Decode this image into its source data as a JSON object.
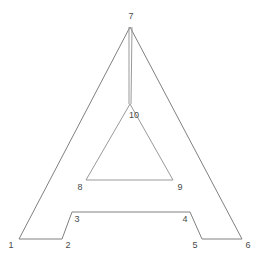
{
  "figure": {
    "background_color": "#ffffff",
    "stroke_color": "#808080",
    "inner_stroke_color": "#999999",
    "label_color": "#4a4a4a",
    "stroke_width": 1,
    "width": 262,
    "height": 260
  },
  "outer_outline": {
    "name": "letter-a-outer-outline",
    "points": "19,239 62,239 72,212 190,212 202,239 242,239 130,27 19,239"
  },
  "inner_counter": {
    "name": "letter-a-inner-triangle",
    "points": "86,180 173,180 130,104 86,180"
  },
  "stem_segments": [
    {
      "name": "stem-left-line",
      "x1": 129,
      "y1": 27,
      "x2": 129,
      "y2": 104
    },
    {
      "name": "stem-right-line",
      "x1": 132,
      "y1": 27,
      "x2": 131,
      "y2": 104
    }
  ],
  "vertices": [
    {
      "id": "1",
      "label": "1",
      "x": 19,
      "y": 239,
      "label_x": 11,
      "label_y": 245
    },
    {
      "id": "2",
      "label": "2",
      "x": 62,
      "y": 239,
      "label_x": 68,
      "label_y": 245
    },
    {
      "id": "3",
      "label": "3",
      "x": 72,
      "y": 212,
      "label_x": 77,
      "label_y": 219
    },
    {
      "id": "4",
      "label": "4",
      "x": 190,
      "y": 212,
      "label_x": 185,
      "label_y": 219
    },
    {
      "id": "5",
      "label": "5",
      "x": 202,
      "y": 239,
      "label_x": 195,
      "label_y": 245
    },
    {
      "id": "6",
      "label": "6",
      "x": 242,
      "y": 239,
      "label_x": 248,
      "label_y": 245
    },
    {
      "id": "7",
      "label": "7",
      "x": 130,
      "y": 27,
      "label_x": 131,
      "label_y": 16
    },
    {
      "id": "8",
      "label": "8",
      "x": 86,
      "y": 180,
      "label_x": 80,
      "label_y": 187
    },
    {
      "id": "9",
      "label": "9",
      "x": 173,
      "y": 180,
      "label_x": 180,
      "label_y": 187
    },
    {
      "id": "10",
      "label": "10",
      "x": 130,
      "y": 104,
      "label_x": 134,
      "label_y": 115
    }
  ]
}
